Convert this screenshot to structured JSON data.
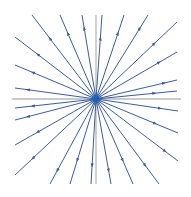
{
  "diagram": {
    "type": "phase-portrait",
    "colors": {
      "background": "#ffffff",
      "axis": "#b8b8b8",
      "trajectory": "#3d5c9e",
      "origin": "#1f5fb8"
    },
    "origin": [
      96,
      99
    ],
    "axes": {
      "x": {
        "from": [
          12,
          99
        ],
        "to": [
          181,
          99
        ]
      },
      "y": {
        "from": [
          96,
          15
        ],
        "to": [
          96,
          184
        ]
      }
    },
    "arrow_direction": "outward",
    "trajectories": [
      {
        "end": [
          32,
          15
        ]
      },
      {
        "end": [
          60,
          15
        ]
      },
      {
        "end": [
          82,
          15
        ]
      },
      {
        "end": [
          15,
          37
        ]
      },
      {
        "end": [
          15,
          65
        ]
      },
      {
        "end": [
          15,
          88
        ]
      },
      {
        "end": [
          102,
          15
        ]
      },
      {
        "end": [
          124,
          15
        ]
      },
      {
        "end": [
          148,
          15
        ]
      },
      {
        "end": [
          177,
          22
        ]
      },
      {
        "end": [
          177,
          52
        ]
      },
      {
        "end": [
          177,
          80
        ]
      },
      {
        "end": [
          177,
          91
        ]
      },
      {
        "end": [
          15,
          108
        ]
      },
      {
        "end": [
          15,
          120
        ]
      },
      {
        "end": [
          15,
          145
        ]
      },
      {
        "end": [
          15,
          175
        ]
      },
      {
        "end": [
          50,
          184
        ]
      },
      {
        "end": [
          70,
          184
        ]
      },
      {
        "end": [
          91,
          184
        ]
      },
      {
        "end": [
          111,
          184
        ]
      },
      {
        "end": [
          133,
          184
        ]
      },
      {
        "end": [
          159,
          184
        ]
      },
      {
        "end": [
          178,
          161
        ]
      },
      {
        "end": [
          178,
          133
        ]
      },
      {
        "end": [
          178,
          111
        ]
      }
    ]
  }
}
